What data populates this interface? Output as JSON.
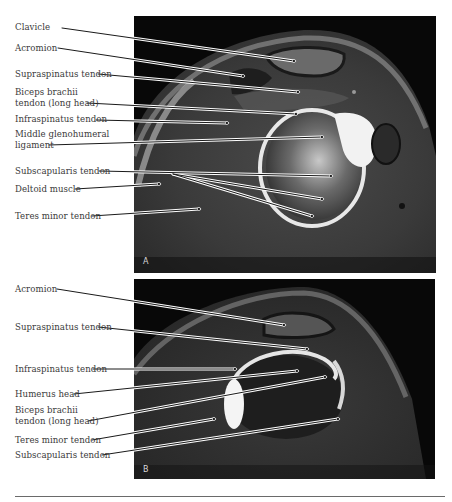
{
  "figure": {
    "panels": [
      {
        "id": "A",
        "letter": "A",
        "labels": [
          {
            "text": "Clavicle",
            "line1": "Clavicle",
            "line2": ""
          },
          {
            "text": "Acromion",
            "line1": "Acromion",
            "line2": ""
          },
          {
            "text": "Supraspinatus tendon",
            "line1": "Supraspinatus tendon",
            "line2": ""
          },
          {
            "text": "Biceps brachii tendon (long head)",
            "line1": "Biceps brachii",
            "line2": "tendon (long head)"
          },
          {
            "text": "Infraspinatus tendon",
            "line1": "Infraspinatus tendon",
            "line2": ""
          },
          {
            "text": "Middle glenohumeral ligament",
            "line1": "Middle glenohumeral",
            "line2": "ligament"
          },
          {
            "text": "Subscapularis tendon",
            "line1": "Subscapularis tendon",
            "line2": ""
          },
          {
            "text": "Deltoid muscle",
            "line1": "Deltoid muscle",
            "line2": ""
          },
          {
            "text": "Teres minor tendon",
            "line1": "Teres minor tendon",
            "line2": ""
          }
        ]
      },
      {
        "id": "B",
        "letter": "B",
        "labels": [
          {
            "text": "Acromion",
            "line1": "Acromion",
            "line2": ""
          },
          {
            "text": "Supraspinatus tendon",
            "line1": "Supraspinatus tendon",
            "line2": ""
          },
          {
            "text": "Infraspinatus tendon",
            "line1": "Infraspinatus tendon",
            "line2": ""
          },
          {
            "text": "Humerus head",
            "line1": "Humerus head",
            "line2": ""
          },
          {
            "text": "Biceps brachii tendon (long head)",
            "line1": "Biceps brachii",
            "line2": "tendon (long head)"
          },
          {
            "text": "Teres minor tendon",
            "line1": "Teres minor tendon",
            "line2": ""
          },
          {
            "text": "Subscapularis tendon",
            "line1": "Subscapularis tendon",
            "line2": ""
          }
        ]
      }
    ],
    "colors": {
      "label_text": "#3a3a3a",
      "leader_line": "#1a1a1a",
      "leader_halo": "#ffffff",
      "image_bg": "#0a0a0a"
    }
  }
}
